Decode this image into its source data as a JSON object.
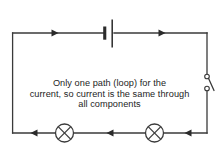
{
  "diagram": {
    "stroke_color": "#3a3a3a",
    "background_color": "#ffffff",
    "text_color": "#1d1d1d"
  },
  "caption": {
    "line1": "Only one path (loop) for the",
    "line2": "current, so current is the same through",
    "line3": "all components"
  },
  "components": {
    "battery": {
      "name": "battery",
      "label": ""
    },
    "switch": {
      "name": "switch",
      "label": "",
      "state": "open"
    },
    "lamp_left": {
      "name": "lamp",
      "label": ""
    },
    "lamp_right": {
      "name": "lamp",
      "label": ""
    }
  },
  "current_arrows": [
    {
      "id": "top-left",
      "direction": "right"
    },
    {
      "id": "top-right",
      "direction": "right"
    },
    {
      "id": "bottom-right",
      "direction": "left"
    },
    {
      "id": "bottom-middle",
      "direction": "left"
    },
    {
      "id": "bottom-left",
      "direction": "left"
    }
  ]
}
